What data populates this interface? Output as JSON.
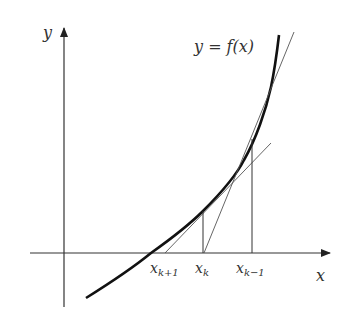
{
  "diagram": {
    "type": "newton-secant-iteration",
    "axes": {
      "x_label": "x",
      "y_label": "y"
    },
    "curve_label": "y = f(x)",
    "points": [
      {
        "name": "x_{k+1}",
        "base": "x",
        "sub": "k+1"
      },
      {
        "name": "x_k",
        "base": "x",
        "sub": "k"
      },
      {
        "name": "x_{k-1}",
        "base": "x",
        "sub": "k−1"
      }
    ],
    "colors": {
      "curve": "#111111",
      "lines": "#444444",
      "text": "#333333"
    }
  }
}
